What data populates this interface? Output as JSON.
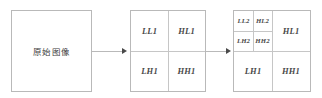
{
  "diagram": {
    "source": {
      "label": "原始图像"
    },
    "arrows": [
      {
        "name": "arrow-source-to-level1"
      },
      {
        "name": "arrow-level1-to-level2"
      }
    ],
    "level1": {
      "subbands": [
        {
          "key": "LL1",
          "label": "LL1"
        },
        {
          "key": "HL1",
          "label": "HL1"
        },
        {
          "key": "LH1",
          "label": "LH1"
        },
        {
          "key": "HH1",
          "label": "HH1"
        }
      ]
    },
    "level2": {
      "subbands": [
        {
          "key": "LL2",
          "label": "LL2"
        },
        {
          "key": "HL2",
          "label": "HL2"
        },
        {
          "key": "LH2",
          "label": "LH2"
        },
        {
          "key": "HH2",
          "label": "HH2"
        },
        {
          "key": "HL1",
          "label": "HL1"
        },
        {
          "key": "LH1",
          "label": "LH1"
        },
        {
          "key": "HH1",
          "label": "HH1"
        }
      ]
    },
    "colors": {
      "border": "#b9b9b9",
      "divider": "#c6c6c6",
      "text": "#4a4a4a",
      "source_text": "#3d3d3d",
      "background": "#ffffff"
    }
  }
}
